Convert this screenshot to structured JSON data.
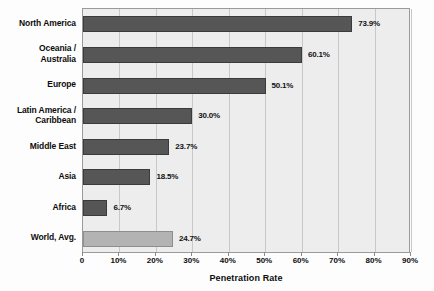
{
  "chart_data": {
    "type": "bar",
    "orientation": "horizontal",
    "title": "",
    "xlabel": "Penetration Rate",
    "ylabel": "",
    "xlim": [
      0,
      90
    ],
    "grid": true,
    "legend": false,
    "categories": [
      "North America",
      "Oceania /\nAustralia",
      "Europe",
      "Latin America /\nCaribbean",
      "Middle East",
      "Asia",
      "Africa",
      "World, Avg."
    ],
    "values": [
      73.9,
      60.1,
      50.1,
      30.0,
      23.7,
      18.5,
      6.7,
      24.7
    ],
    "value_labels": [
      "73.9%",
      "60.1%",
      "50.1%",
      "30.0%",
      "23.7%",
      "18.5%",
      "6.7%",
      "24.7%"
    ],
    "xticks": [
      0,
      10,
      20,
      30,
      40,
      50,
      60,
      70,
      80,
      90
    ],
    "xtick_labels": [
      "0",
      "10%",
      "20%",
      "30%",
      "40%",
      "50%",
      "60%",
      "70%",
      "80%",
      "90%"
    ],
    "bar_colors": [
      "#565656",
      "#565656",
      "#565656",
      "#565656",
      "#565656",
      "#565656",
      "#565656",
      "#b3b3b3"
    ],
    "colors": {
      "bar_default": "#565656",
      "bar_highlight": "#b3b3b3",
      "plot_background": "#ededed",
      "gridline": "#c8c8c8",
      "axis_border": "#9a9a9a",
      "text": "#0d0d0d"
    }
  }
}
